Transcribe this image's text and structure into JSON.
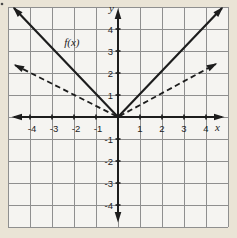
{
  "colors": {
    "outer_background": "#eae4d6",
    "plot_background": "#f5f4f1",
    "grid_line": "#8f8f8f",
    "axis_and_curves": "#1d1d1d"
  },
  "chart_data": {
    "type": "line",
    "title": "",
    "xlabel": "x",
    "ylabel": "y",
    "xlim": [
      -5,
      5
    ],
    "ylim": [
      -5,
      5
    ],
    "grid": true,
    "legend": "none",
    "x_tick_values": [
      -4,
      -3,
      -2,
      -1,
      1,
      2,
      3,
      4
    ],
    "x_tick_labels": [
      "-4",
      "-3",
      "-2",
      "-1",
      "1",
      "2",
      "3",
      "4"
    ],
    "y_tick_values": [
      4,
      3,
      2,
      1,
      -1,
      -2,
      -3,
      -4
    ],
    "y_tick_labels": [
      "4",
      "3",
      "2",
      "1",
      "-1",
      "-2",
      "-3",
      "-4"
    ],
    "series": [
      {
        "name": "f(x) = |x|",
        "line_style": "solid",
        "arrows": "both",
        "points": [
          [
            -4.73,
            4.95
          ],
          [
            0,
            0
          ],
          [
            4.73,
            4.95
          ]
        ],
        "annotation": {
          "text": "f(x)",
          "x": -2.1,
          "y": 3.4
        }
      },
      {
        "name": "y = |x| / 2",
        "line_style": "dashed",
        "arrows": "both",
        "points": [
          [
            -4.68,
            2.36
          ],
          [
            0,
            0
          ],
          [
            4.45,
            2.41
          ]
        ],
        "annotation": null
      }
    ]
  }
}
